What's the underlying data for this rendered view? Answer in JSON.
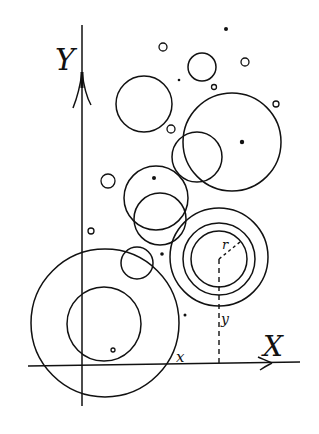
{
  "diagram": {
    "colors": {
      "ink": "#111111",
      "background": "#ffffff"
    },
    "axes": {
      "x_label": "X",
      "y_label": "Y",
      "origin": [
        82,
        366
      ],
      "x_axis": {
        "from": [
          28,
          366
        ],
        "to": [
          300,
          362
        ]
      },
      "y_axis": {
        "from": [
          82,
          25
        ],
        "to": [
          82,
          406
        ]
      }
    },
    "annotations": {
      "radius_label": "r",
      "x_coord_label": "x",
      "y_coord_label": "y"
    },
    "circles": [
      {
        "id": "big-bottom-left",
        "cx": 105,
        "cy": 323,
        "r": 74
      },
      {
        "id": "inner-bottom-left",
        "cx": 104,
        "cy": 324,
        "r": 37
      },
      {
        "id": "small-near-bottom",
        "cx": 137,
        "cy": 263,
        "r": 16
      },
      {
        "id": "mid-upper",
        "cx": 156,
        "cy": 198,
        "r": 32
      },
      {
        "id": "mid-lower",
        "cx": 160,
        "cy": 219,
        "r": 26
      },
      {
        "id": "top-left",
        "cx": 144,
        "cy": 104,
        "r": 28
      },
      {
        "id": "top-small",
        "cx": 202,
        "cy": 67,
        "r": 14
      },
      {
        "id": "big-right",
        "cx": 232,
        "cy": 142,
        "r": 49
      },
      {
        "id": "overlap-right",
        "cx": 197,
        "cy": 157,
        "r": 25
      },
      {
        "id": "ring-outer",
        "cx": 219,
        "cy": 257,
        "r": 49
      },
      {
        "id": "ring-middle",
        "cx": 219,
        "cy": 259,
        "r": 36
      },
      {
        "id": "ring-inner",
        "cx": 219,
        "cy": 259,
        "r": 28
      },
      {
        "id": "tiny-o-1",
        "cx": 163,
        "cy": 47,
        "r": 4
      },
      {
        "id": "tiny-o-2",
        "cx": 171,
        "cy": 129,
        "r": 4
      },
      {
        "id": "tiny-o-3",
        "cx": 245,
        "cy": 62,
        "r": 4
      },
      {
        "id": "tiny-o-4",
        "cx": 276,
        "cy": 104,
        "r": 3
      },
      {
        "id": "tiny-o-5",
        "cx": 108,
        "cy": 181,
        "r": 7
      },
      {
        "id": "tiny-o-6",
        "cx": 91,
        "cy": 231,
        "r": 3
      },
      {
        "id": "tiny-o-7",
        "cx": 214,
        "cy": 87,
        "r": 2.5
      },
      {
        "id": "tiny-o-8",
        "cx": 113,
        "cy": 350,
        "r": 2
      }
    ],
    "dots": [
      {
        "id": "dot-top",
        "cx": 226,
        "cy": 29,
        "r": 2
      },
      {
        "id": "dot-left-top",
        "cx": 179,
        "cy": 80,
        "r": 1.3
      },
      {
        "id": "dot-big-right-center",
        "cx": 242,
        "cy": 142,
        "r": 2.2
      },
      {
        "id": "dot-mid-upper",
        "cx": 154,
        "cy": 178,
        "r": 2
      },
      {
        "id": "dot-near-ring",
        "cx": 162,
        "cy": 254,
        "r": 1.8
      },
      {
        "id": "dot-low-right",
        "cx": 185,
        "cy": 315,
        "r": 1.5
      }
    ],
    "measure": {
      "center": [
        219,
        259
      ],
      "radius_end": [
        240,
        242
      ],
      "foot": [
        219,
        366
      ]
    }
  }
}
